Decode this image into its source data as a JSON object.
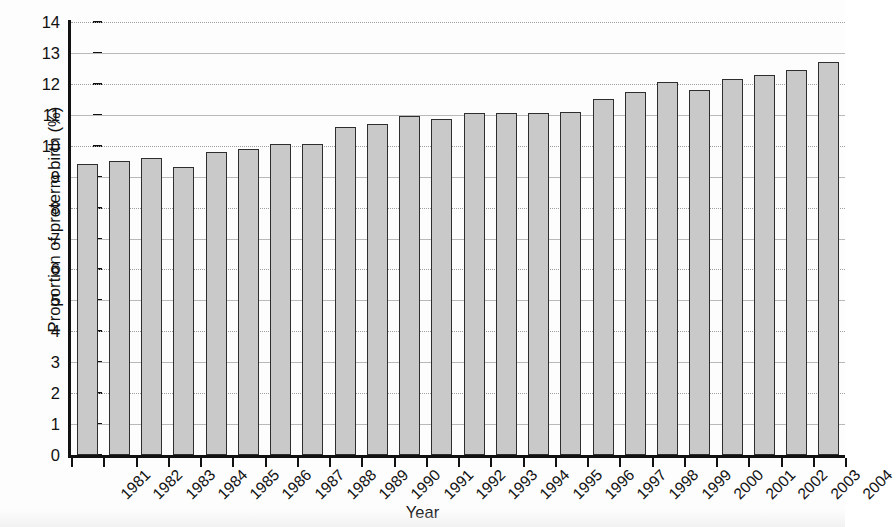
{
  "chart_data": {
    "type": "bar",
    "title": "",
    "xlabel": "Year",
    "ylabel": "Proportion of preterm birth (%)",
    "categories": [
      "1981",
      "1982",
      "1983",
      "1984",
      "1985",
      "1986",
      "1987",
      "1988",
      "1989",
      "1990",
      "1991",
      "1992",
      "1993",
      "1994",
      "1995",
      "1996",
      "1997",
      "1998",
      "1999",
      "2000",
      "2001",
      "2002",
      "2003",
      "2004"
    ],
    "values": [
      9.4,
      9.5,
      9.6,
      9.3,
      9.8,
      9.9,
      10.05,
      10.05,
      10.6,
      10.7,
      10.95,
      10.85,
      11.05,
      11.05,
      11.05,
      11.1,
      11.5,
      11.75,
      12.05,
      11.8,
      12.15,
      12.3,
      12.45,
      12.7
    ],
    "ylim": [
      0,
      14
    ],
    "ytick_labels": [
      "0",
      "1",
      "2",
      "3",
      "4",
      "5",
      "6",
      "7",
      "8",
      "9",
      "10",
      "11",
      "12",
      "13",
      "14"
    ],
    "ytick_values": [
      0,
      1,
      2,
      3,
      4,
      5,
      6,
      7,
      8,
      9,
      10,
      11,
      12,
      13,
      14
    ],
    "grid": true,
    "grid_axis": "y",
    "legend": null,
    "series_name": "Proportion of preterm birth",
    "bar_fill_color": "#c9c9c9",
    "bar_edge_color": "#2e2e2e",
    "gridline_color": "#b9b9b9",
    "axis_color": "#111111",
    "background_color": "#fdfdfd",
    "note": "Last bar (2004) is clipped at the right edge of the figure"
  }
}
